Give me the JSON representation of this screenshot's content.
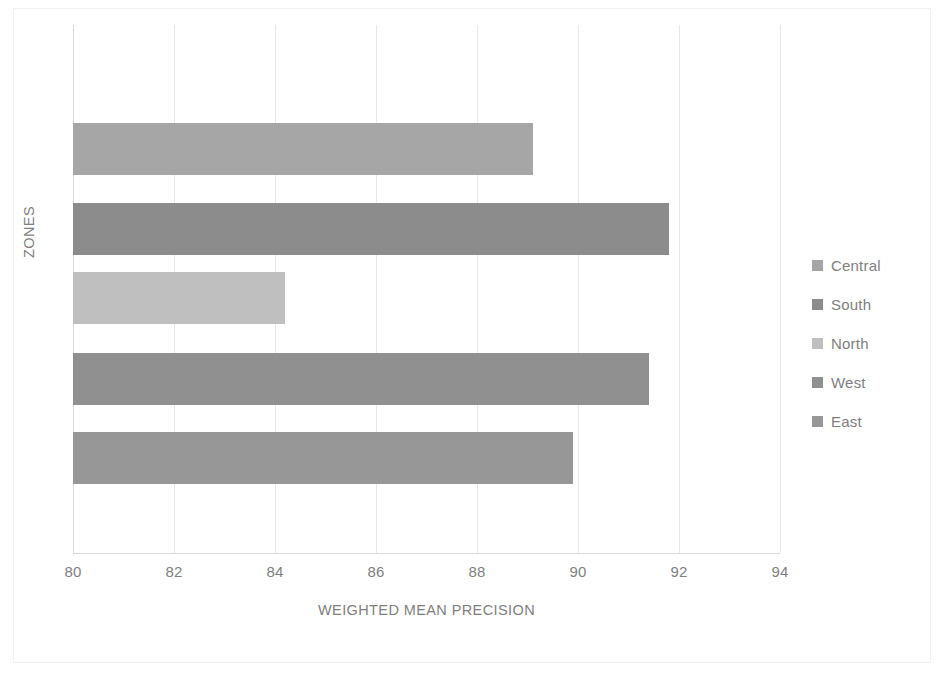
{
  "chart_data": {
    "type": "bar",
    "orientation": "horizontal",
    "title": "",
    "xlabel": "WEIGHTED MEAN PRECISION",
    "ylabel": "ZONES",
    "xlim": [
      80,
      94
    ],
    "ylim": null,
    "grid": true,
    "legend_position": "right",
    "xticks": [
      "80",
      "82",
      "84",
      "86",
      "88",
      "90",
      "92",
      "94"
    ],
    "xtick_values": [
      80,
      82,
      84,
      86,
      88,
      90,
      92,
      94
    ],
    "categories": [
      "Central",
      "South",
      "North",
      "West",
      "East"
    ],
    "values": [
      89.1,
      91.8,
      84.2,
      91.4,
      89.9
    ],
    "series": [
      {
        "name": "Central",
        "value": 89.1,
        "color": "#a6a6a6"
      },
      {
        "name": "South",
        "value": 91.8,
        "color": "#8c8c8c"
      },
      {
        "name": "North",
        "value": 84.2,
        "color": "#bfbfbf"
      },
      {
        "name": "West",
        "value": 91.4,
        "color": "#909090"
      },
      {
        "name": "East",
        "value": 89.9,
        "color": "#979797"
      }
    ],
    "legend_entries": [
      {
        "label": "Central",
        "color": "#a6a6a6"
      },
      {
        "label": "South",
        "color": "#8c8c8c"
      },
      {
        "label": "North",
        "color": "#bfbfbf"
      },
      {
        "label": "West",
        "color": "#909090"
      },
      {
        "label": "East",
        "color": "#979797"
      }
    ],
    "colors": {
      "background": "#ffffff",
      "gridline": "#e8e8e8",
      "axis": "#d9d9d9",
      "text": "#7f7f7f",
      "frame": "#f2f2f2"
    }
  }
}
